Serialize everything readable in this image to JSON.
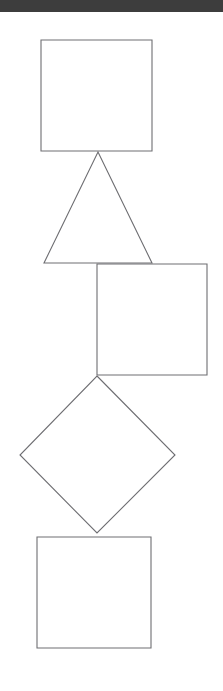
{
  "canvas": {
    "width": 223,
    "height": 691,
    "background_color": "#ffffff",
    "description": "Vertical chain of five outlined geometric shapes touching at single points"
  },
  "top_bar": {
    "name": "top-bar",
    "color": "#3d3d3d",
    "height": 12,
    "label": ""
  },
  "style": {
    "shape_fill": "#ffffff",
    "shape_stroke": "#6e6e72",
    "shape_stroke_width": 1.1
  },
  "shapes": [
    {
      "id": "shape-1",
      "name": "square-top",
      "kind": "square",
      "order": 1,
      "points": "41,40 152,40 152,151 41,151",
      "label": ""
    },
    {
      "id": "shape-2",
      "name": "triangle",
      "kind": "triangle",
      "order": 2,
      "points": "98,152 152,263 44,263",
      "label": ""
    },
    {
      "id": "shape-3",
      "name": "square-right",
      "kind": "square",
      "order": 3,
      "points": "97,264 207,264 207,375 97,375",
      "label": ""
    },
    {
      "id": "shape-4",
      "name": "diamond",
      "kind": "diamond",
      "order": 4,
      "points": "97,376 175,455 97,533 20,455",
      "label": ""
    },
    {
      "id": "shape-5",
      "name": "square-bottom",
      "kind": "square",
      "order": 5,
      "points": "37,537 151,537 151,648 37,648",
      "label": ""
    }
  ]
}
